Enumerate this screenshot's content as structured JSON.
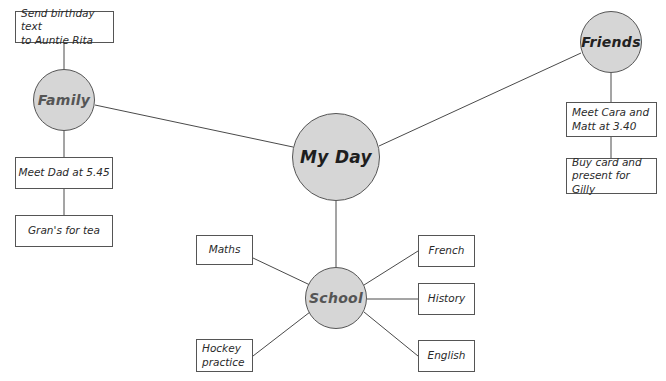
{
  "diagram": {
    "type": "mind-map",
    "central": {
      "id": "my-day",
      "label": "My Day",
      "cx": 336,
      "cy": 157,
      "r": 44
    },
    "branches": [
      {
        "id": "family",
        "label": "Family",
        "cx": 64,
        "cy": 100,
        "r": 31,
        "items": [
          {
            "id": "send-birthday-text",
            "label": "Send birthday text\nto Auntie Rita",
            "x": 15,
            "y": 11,
            "w": 99,
            "h": 32
          },
          {
            "id": "meet-dad",
            "label": "Meet Dad at 5.45",
            "x": 15,
            "y": 157,
            "w": 98,
            "h": 32
          },
          {
            "id": "grans-for-tea",
            "label": "Gran's for tea",
            "x": 15,
            "y": 215,
            "w": 98,
            "h": 32
          }
        ]
      },
      {
        "id": "friends",
        "label": "Friends",
        "cx": 611,
        "cy": 42,
        "r": 31,
        "items": [
          {
            "id": "meet-cara-matt",
            "label": "Meet Cara and\nMatt at 3.40",
            "x": 566,
            "y": 102,
            "w": 91,
            "h": 35
          },
          {
            "id": "buy-card-present",
            "label": "Buy card and\npresent for Gilly",
            "x": 566,
            "y": 158,
            "w": 91,
            "h": 36
          }
        ]
      },
      {
        "id": "school",
        "label": "School",
        "cx": 336,
        "cy": 298,
        "r": 31,
        "items": [
          {
            "id": "maths",
            "label": "Maths",
            "x": 196,
            "y": 235,
            "w": 57,
            "h": 30
          },
          {
            "id": "hockey-practice",
            "label": "Hockey\npractice",
            "x": 196,
            "y": 339,
            "w": 57,
            "h": 33
          },
          {
            "id": "french",
            "label": "French",
            "x": 418,
            "y": 235,
            "w": 57,
            "h": 32
          },
          {
            "id": "history",
            "label": "History",
            "x": 418,
            "y": 283,
            "w": 57,
            "h": 32
          },
          {
            "id": "english",
            "label": "English",
            "x": 418,
            "y": 340,
            "w": 57,
            "h": 32
          }
        ]
      }
    ],
    "connections": [
      {
        "from": "my-day",
        "to": "family",
        "x1": 293,
        "y1": 147,
        "x2": 95,
        "y2": 105
      },
      {
        "from": "my-day",
        "to": "friends",
        "x1": 379,
        "y1": 146,
        "x2": 581,
        "y2": 53
      },
      {
        "from": "my-day",
        "to": "school",
        "x1": 336,
        "y1": 201,
        "x2": 336,
        "y2": 267
      },
      {
        "from": "family",
        "to": "send-birthday-text",
        "x1": 64,
        "y1": 43,
        "x2": 64,
        "y2": 69
      },
      {
        "from": "family",
        "to": "meet-dad",
        "x1": 64,
        "y1": 131,
        "x2": 64,
        "y2": 157
      },
      {
        "from": "meet-dad",
        "to": "grans-for-tea",
        "x1": 64,
        "y1": 189,
        "x2": 64,
        "y2": 215
      },
      {
        "from": "friends",
        "to": "meet-cara-matt",
        "x1": 611,
        "y1": 73,
        "x2": 611,
        "y2": 102
      },
      {
        "from": "meet-cara-matt",
        "to": "buy-card-present",
        "x1": 611,
        "y1": 137,
        "x2": 611,
        "y2": 158
      },
      {
        "from": "school",
        "to": "maths",
        "x1": 253,
        "y1": 258,
        "x2": 310,
        "y2": 285
      },
      {
        "from": "school",
        "to": "hockey-practice",
        "x1": 253,
        "y1": 356,
        "x2": 310,
        "y2": 312
      },
      {
        "from": "school",
        "to": "french",
        "x1": 418,
        "y1": 251,
        "x2": 364,
        "y2": 285
      },
      {
        "from": "school",
        "to": "history",
        "x1": 418,
        "y1": 299,
        "x2": 367,
        "y2": 299
      },
      {
        "from": "school",
        "to": "english",
        "x1": 418,
        "y1": 356,
        "x2": 364,
        "y2": 312
      }
    ]
  },
  "colors": {
    "circle_fill": "#d6d6d6",
    "stroke": "#555555",
    "box_fill": "#ffffff",
    "background": "#ffffff"
  }
}
